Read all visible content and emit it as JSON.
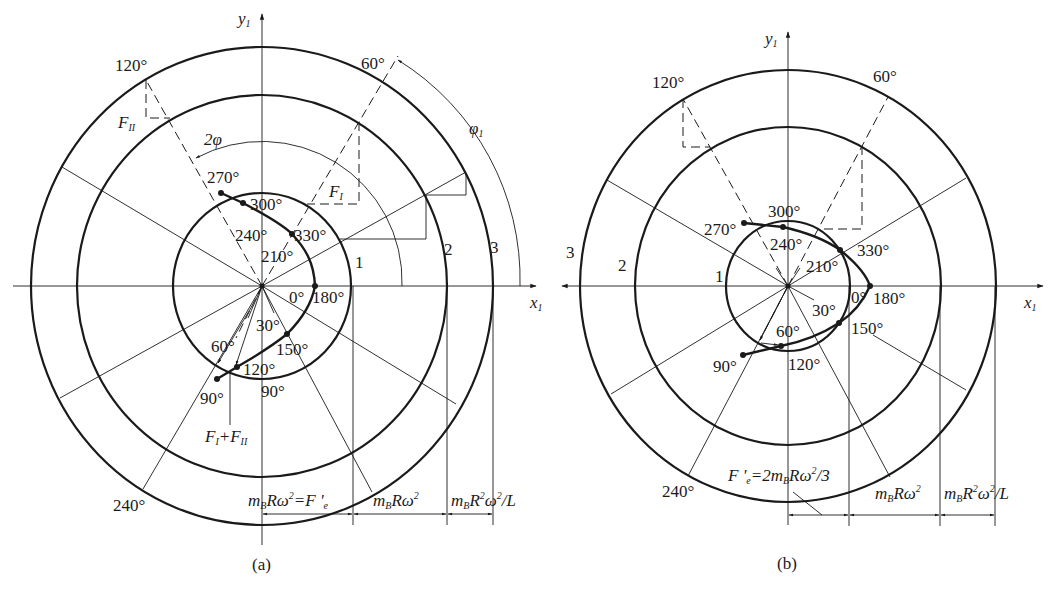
{
  "figure_a": {
    "caption": "(a)",
    "axis_x": "x",
    "axis_x_sub": "1",
    "axis_y": "y",
    "axis_y_sub": "1",
    "ring_labels": [
      "1",
      "2",
      "3"
    ],
    "outer_angle_labels": {
      "a120": "120°",
      "a60": "60°",
      "a240": "240°"
    },
    "curve_labels": {
      "p270": "270°",
      "p300": "300°",
      "p240": "240°",
      "p330": "330°",
      "p210": "210°",
      "p0": "0°",
      "p180": "180°",
      "p30": "30°",
      "p150": "150°",
      "p60": "60°",
      "p120": "120°",
      "p90a": "90°",
      "p90b": "90°"
    },
    "force_labels": {
      "F_II": "F",
      "F_II_sub": "II",
      "F_I": "F",
      "F_I_sub": "I",
      "sum_F1": "F",
      "sum_F1_sub": "I",
      "sum_plus": "+",
      "sum_F2": "F",
      "sum_F2_sub": "II"
    },
    "angle_labels": {
      "two_phi": "2φ",
      "phi1": "φ",
      "phi1_sub": "1"
    },
    "dimensions": [
      {
        "m": "m",
        "sub": "B",
        "rest": "Rω",
        "sup": "2",
        "tail": "=F '",
        "tail_sub": "e"
      },
      {
        "m": "m",
        "sub": "B",
        "rest": "Rω",
        "sup": "2"
      },
      {
        "m": "m",
        "sub": "B",
        "rest": "R",
        "sup": "2",
        "rest2": "ω",
        "sup2": "2",
        "tail": "/L"
      }
    ]
  },
  "figure_b": {
    "caption": "(b)",
    "axis_x": "x",
    "axis_x_sub": "1",
    "axis_x_left": "x",
    "axis_x_left_sub": "1",
    "axis_y": "y",
    "axis_y_sub": "1",
    "ring_labels": [
      "1",
      "2",
      "3"
    ],
    "outer_angle_labels": {
      "a120": "120°",
      "a60": "60°",
      "a240": "240°"
    },
    "curve_labels": {
      "p270": "270°",
      "p300": "300°",
      "p240": "240°",
      "p330": "330°",
      "p210": "210°",
      "p0": "0°",
      "p180": "180°",
      "p30": "30°",
      "p150": "150°",
      "p60": "60°",
      "p120": "120°",
      "p90": "90°"
    },
    "dimensions": [
      {
        "pre": "F '",
        "pre_sub": "e",
        "mid": "=2m",
        "sub": "B",
        "rest": "Rω",
        "sup": "2",
        "tail": "/3"
      },
      {
        "m": "m",
        "sub": "B",
        "rest": "Rω",
        "sup": "2"
      },
      {
        "m": "m",
        "sub": "B",
        "rest": "R",
        "sup": "2",
        "rest2": "ω",
        "sup2": "2",
        "tail": "/L"
      }
    ]
  },
  "colors": {
    "ink": "#1a1a1a",
    "background": "#ffffff"
  }
}
